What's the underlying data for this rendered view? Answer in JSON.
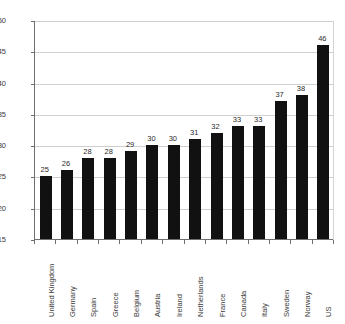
{
  "chart_data": {
    "type": "bar",
    "title": "",
    "subtitle": "",
    "xlabel": "",
    "ylabel": "",
    "ylim": [
      15,
      50
    ],
    "ytick_values": [
      15,
      20,
      25,
      30,
      35,
      40,
      45,
      50
    ],
    "ytick_labels": [
      "15",
      "20",
      "25",
      "30",
      "35",
      "40",
      "45",
      "50"
    ],
    "grid": "horizontal",
    "legend": "none",
    "bar_color": "#111111",
    "gridline_color": "#cfcfcf",
    "axis_color": "#6f6f6f",
    "categories": [
      "United Kingdom",
      "Germany",
      "Spain",
      "Greece",
      "Belgium",
      "Austria",
      "Ireland",
      "Netherlands",
      "France",
      "Canada",
      "Italy",
      "Sweden",
      "Norway",
      "US"
    ],
    "values": [
      25,
      26,
      28,
      28,
      29,
      30,
      30,
      31,
      32,
      33,
      33,
      37,
      38,
      46
    ],
    "data_labels": [
      "25",
      "26",
      "28",
      "28",
      "29",
      "30",
      "30",
      "31",
      "32",
      "33",
      "33",
      "37",
      "38",
      "46"
    ]
  }
}
